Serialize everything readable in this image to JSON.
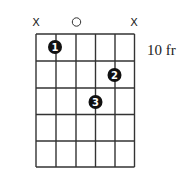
{
  "diagram": {
    "type": "guitar-chord-chart",
    "fret_position_label": "10 fr",
    "num_strings": 6,
    "num_frets": 5,
    "string_markers": [
      {
        "string": 1,
        "symbol": "X",
        "meaning": "muted"
      },
      {
        "string": 2,
        "symbol": "",
        "meaning": "fretted"
      },
      {
        "string": 3,
        "symbol": "O",
        "meaning": "open"
      },
      {
        "string": 4,
        "symbol": "",
        "meaning": "fretted"
      },
      {
        "string": 5,
        "symbol": "",
        "meaning": "fretted"
      },
      {
        "string": 6,
        "symbol": "X",
        "meaning": "muted"
      }
    ],
    "fingers": [
      {
        "finger": "1",
        "string": 2,
        "fret": 1
      },
      {
        "finger": "2",
        "string": 5,
        "fret": 2
      },
      {
        "finger": "3",
        "string": 4,
        "fret": 3
      }
    ],
    "colors": {
      "grid": "#333333",
      "dot": "#111111",
      "dot_text": "#ffffff"
    }
  }
}
